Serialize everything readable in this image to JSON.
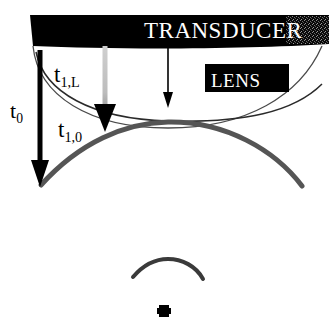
{
  "figure": {
    "name": "acoustic-lens-focusing-diagram",
    "width": 329,
    "height": 331,
    "background_color": "#ffffff"
  },
  "transducer": {
    "label": "TRANSDUCER",
    "text_color": "#ffffff",
    "bar_color": "#000000",
    "bar": {
      "x": 30,
      "y": 15,
      "width": 299,
      "height": 31
    },
    "noise_patch": {
      "x": 286,
      "y": 16,
      "width": 43,
      "height": 28
    }
  },
  "lens": {
    "label": "LENS",
    "text_color": "#ffffff",
    "box_color": "#000000",
    "box": {
      "x": 205,
      "y": 64,
      "width": 84,
      "height": 28
    },
    "outline_color": "#4a4a4a"
  },
  "labels": {
    "t0": {
      "base": "t",
      "sub": "0"
    },
    "t1L": {
      "base": "t",
      "sub": "1,L"
    },
    "t10": {
      "base": "t",
      "sub": "1,0"
    }
  },
  "arrows": {
    "t0_arrow": {
      "color": "#000000",
      "x": 40,
      "y_start": 50,
      "y_end": 185,
      "width": 5
    },
    "lens_edge_arrow": {
      "color": "#000000",
      "shaft_color": "#b4b4b4",
      "x": 105,
      "y_start": 46,
      "y_end": 131
    },
    "center_arrow": {
      "color": "#000000",
      "x": 168,
      "y_start": 48,
      "y_end": 107,
      "width": 1.6
    }
  },
  "wavefronts": {
    "planar_at_lens": {
      "description": "thin curve, lens lower surface",
      "color": "#2a2a2a"
    },
    "converging_large": {
      "description": "thick arc below lens",
      "color": "#555555",
      "thickness": 5
    },
    "converging_small": {
      "description": "small arc near focus",
      "color": "#3a3a3a",
      "thickness": 4
    }
  },
  "focal_point": {
    "description": "focal spot marker",
    "color": "#000000",
    "x": 164,
    "y": 310
  }
}
